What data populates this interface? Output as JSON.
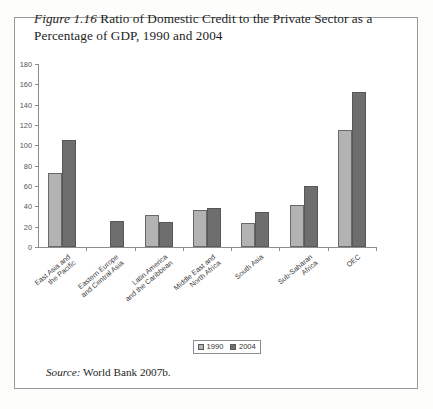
{
  "figure": {
    "label": "Figure 1.16",
    "caption": "Ratio of Domestic Credit to the Private Sector as a Percentage of GDP, 1990 and 2004",
    "source_label": "Source:",
    "source_text": "World Bank 2007b."
  },
  "legend": {
    "position": "bottom-center",
    "items": [
      {
        "label": "1990",
        "color": "#b3b3b3"
      },
      {
        "label": "2004",
        "color": "#6e6e6e"
      }
    ]
  },
  "chart_data": {
    "type": "bar",
    "title": "Figure 1.16 Ratio of Domestic Credit to the Private Sector as a Percentage of GDP, 1990 and 2004",
    "xlabel": "",
    "ylabel": "",
    "ylim": [
      0,
      180
    ],
    "yticks": [
      0,
      20,
      40,
      60,
      80,
      100,
      120,
      140,
      160,
      180
    ],
    "grid": false,
    "legend_position": "bottom-center",
    "categories": [
      "East Asia and\nthe Pacific",
      "Eastern Europe\nand Central Asia",
      "Latin America\nand the Caribbean",
      "Middle East and\nNorth Africa",
      "South Asia",
      "Sub-Saharan\nAfrica",
      "OEC"
    ],
    "category_lines": [
      [
        "East Asia and",
        "the Pacific"
      ],
      [
        "Eastern Europe",
        "and Central Asia"
      ],
      [
        "Latin America",
        "and the Caribbean"
      ],
      [
        "Middle East and",
        "North Africa"
      ],
      [
        "South Asia"
      ],
      [
        "Sub-Saharan",
        "Africa"
      ],
      [
        "OEC"
      ]
    ],
    "series": [
      {
        "name": "1990",
        "color": "#b3b3b3",
        "values": [
          73,
          null,
          31,
          36,
          24,
          41,
          115
        ]
      },
      {
        "name": "2004",
        "color": "#6e6e6e",
        "values": [
          105,
          26,
          25,
          38,
          34,
          60,
          152
        ]
      }
    ]
  }
}
